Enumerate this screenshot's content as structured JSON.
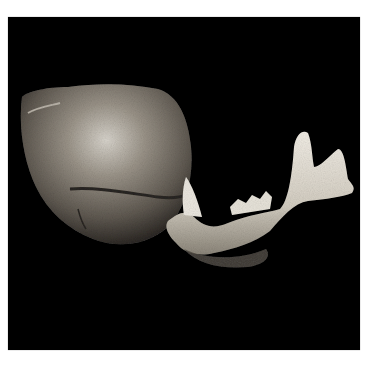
{
  "image": {
    "description": "Photograph of a fossil skull fragment (cranium) and a lower jaw (mandible) of a large carnivore, shown against a black background",
    "background_color": "#000000",
    "page_color": "#ffffff",
    "subjects": [
      {
        "name": "cranium",
        "tone": "mottled grey-brown bone"
      },
      {
        "name": "mandible",
        "tone": "pale cream bone with canine tooth and molars"
      }
    ]
  }
}
